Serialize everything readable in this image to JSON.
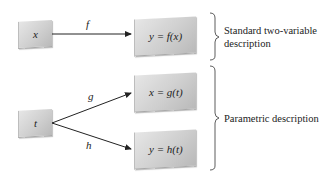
{
  "diagram": {
    "standard": {
      "input_box": "x",
      "function_label": "f",
      "output_box": "y = f(x)",
      "description_line1": "Standard two-variable",
      "description_line2": "description"
    },
    "parametric": {
      "input_box": "t",
      "function_label_top": "g",
      "function_label_bottom": "h",
      "output_box_top": "x = g(t)",
      "output_box_bottom": "y = h(t)",
      "description": "Parametric description"
    },
    "colors": {
      "box_light": "#e6e6e6",
      "box_dark": "#b9b9b9",
      "line": "#222222"
    }
  }
}
